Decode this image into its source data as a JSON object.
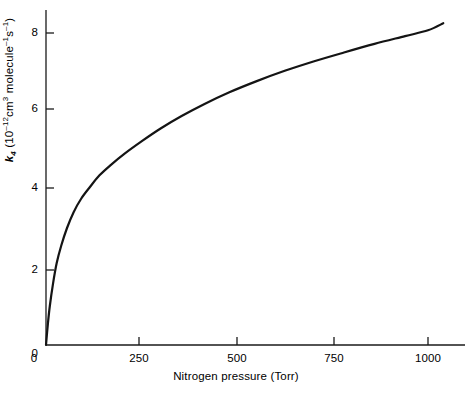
{
  "chart_data": {
    "type": "line",
    "title": "",
    "xlabel": "Nitrogen pressure (Torr)",
    "ylabel_parts": {
      "symbol": "k",
      "symbol_sub": "4",
      "open": " (10",
      "exp1": "–12",
      "mid": "cm",
      "exp2": "3",
      "mid2": " molecule",
      "exp3": "–1",
      "mid3": "s",
      "exp4": "–1",
      "close": ")"
    },
    "ylabel_plain": "k4 (10^-12 cm^3 molecule^-1 s^-1)",
    "xlim": [
      0,
      1100
    ],
    "ylim": [
      0,
      8.7
    ],
    "xticks": [
      0,
      250,
      500,
      750,
      1000
    ],
    "xtick_labels": [
      "0",
      "250",
      "500",
      "750",
      "1000"
    ],
    "yticks": [
      0,
      2,
      4,
      6,
      8
    ],
    "ytick_labels": [
      "0",
      "2",
      "4",
      "6",
      "8"
    ],
    "grid": false,
    "legend": null,
    "series": [
      {
        "name": "k4 vs nitrogen pressure",
        "color": "#141414",
        "linewidth": 2.2,
        "x": [
          0,
          5,
          10,
          18,
          28,
          40,
          55,
          72,
          92,
          115,
          140,
          170,
          205,
          250,
          300,
          355,
          415,
          480,
          550,
          625,
          700,
          780,
          860,
          940,
          1000,
          1040
        ],
        "y": [
          0.0,
          0.55,
          1.0,
          1.55,
          2.1,
          2.55,
          3.0,
          3.4,
          3.75,
          4.05,
          4.35,
          4.62,
          4.9,
          5.22,
          5.55,
          5.87,
          6.18,
          6.48,
          6.76,
          7.03,
          7.27,
          7.5,
          7.72,
          7.92,
          8.07,
          8.25
        ]
      }
    ],
    "axis_geometry": {
      "x_axis_pixel_y": 345,
      "y_axis_pixel_x": 46,
      "x_axis_right_end": 465,
      "y_axis_top_end": 10
    }
  },
  "xtick_positions_px": [
    46,
    139,
    237,
    334,
    428
  ],
  "ytick_positions_px": [
    345,
    270,
    188,
    109,
    33
  ]
}
